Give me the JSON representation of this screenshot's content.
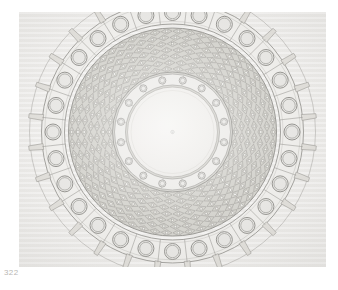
{
  "page": {
    "folio_number": "322",
    "background_color": "#ffffff",
    "plate_color": "#efeeec"
  },
  "plate": {
    "label": "architectural-plan",
    "subject": "circular domed rotunda plan",
    "ink_color": "#8e8d88",
    "hatch_color": "#a3a29c",
    "light_fill": "#e9e8e5",
    "mid_fill": "#c8c7c1",
    "center_marker": true
  },
  "chart_data": {
    "type": "diagram",
    "center": {
      "cx": 153.5,
      "cy": 120.0
    },
    "rings": [
      {
        "name": "outer-buttress-ring",
        "radius": 143,
        "stroke": "#8e8d88",
        "stroke_width": 1.0,
        "description": "outermost faint enclosing circle with radial buttress spurs"
      },
      {
        "name": "buttress-spur-ring",
        "radius": 137,
        "count": 28,
        "stroke": "#8e8d88",
        "description": "small rectangular buttress projections around perimeter"
      },
      {
        "name": "peristyle-outer-wall",
        "radius": 131,
        "stroke": "#8e8d88",
        "stroke_width": 1.2
      },
      {
        "name": "peristyle-inner-wall",
        "radius": 108,
        "stroke": "#8e8d88",
        "stroke_width": 1.2
      },
      {
        "name": "coffered-dome-outer",
        "radius": 104,
        "stroke": "#8e8d88",
        "fill": "#c8c7c1"
      },
      {
        "name": "coffered-dome-inner",
        "radius": 60,
        "stroke": "#8e8d88"
      },
      {
        "name": "drum-outer-wall",
        "radius": 58,
        "stroke": "#8e8d88"
      },
      {
        "name": "drum-inner-wall",
        "radius": 47,
        "stroke": "#8e8d88"
      },
      {
        "name": "oculus-court",
        "radius": 45,
        "fill": "#eeedea",
        "stroke": "#9d9c96"
      }
    ],
    "column_rings": [
      {
        "name": "outer-column-ring",
        "count": 28,
        "radius": 119.5,
        "column_radius": 8.0,
        "inner_radius": 6.2,
        "fill": "#e6e5e2",
        "stroke": "#7e7d78",
        "description": "large circular columns set between radial wall segments"
      },
      {
        "name": "inner-column-ring",
        "count": 16,
        "radius": 52.5,
        "column_radius": 3.6,
        "inner_radius": 2.3,
        "fill": "#e6e5e2",
        "stroke": "#7e7d78",
        "description": "small circular columns around the inner drum"
      }
    ],
    "coffer_pattern": {
      "name": "diamond-coffer-lattice",
      "shape": "nested diamonds with inner square",
      "radial_bands": 7,
      "angular_divisions": 56,
      "stroke": "#8a8984",
      "fill": "#cfcec8"
    },
    "radial_lines": {
      "outer_ring_dividers": 28,
      "drum_dividers": 16,
      "stroke": "#8e8d88"
    }
  }
}
